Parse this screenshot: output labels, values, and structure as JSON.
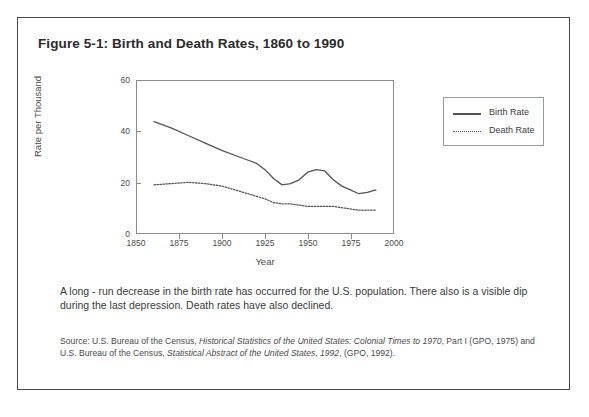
{
  "figure": {
    "title": "Figure 5-1: Birth and Death Rates, 1860 to 1990",
    "caption": "A long - run decrease in the birth rate has occurred for the U.S. population. There also is a visible dip during the last depression. Death rates have also declined.",
    "source": {
      "line1_a": "Source: U.S. Bureau of the Census, ",
      "line1_italic": "Historical Statistics of the United States: Colonial Times to 1970",
      "line1_b": ", Part I",
      "line2_a": "(GPO, 1975) and U.S. Bureau of the Census, ",
      "line2_italic": "Statistical Abstract of the United States, 1992",
      "line2_b": ", (GPO, 1992)."
    }
  },
  "chart_data": {
    "type": "line",
    "title": "Birth and Death Rates, 1860 to 1990",
    "xlabel": "Year",
    "ylabel": "Rate per Thousand",
    "xlim": [
      1850,
      2000
    ],
    "ylim": [
      0,
      60
    ],
    "xticks": [
      1850,
      1875,
      1900,
      1925,
      1950,
      1975,
      2000
    ],
    "yticks": [
      0,
      20,
      40,
      60
    ],
    "grid": false,
    "legend_position": "right",
    "x": [
      1860,
      1870,
      1880,
      1890,
      1900,
      1910,
      1920,
      1925,
      1930,
      1935,
      1940,
      1945,
      1950,
      1955,
      1960,
      1965,
      1970,
      1975,
      1980,
      1985,
      1990
    ],
    "series": [
      {
        "name": "Birth Rate",
        "style": "solid",
        "color": "#545454",
        "values": [
          44.0,
          41.5,
          38.5,
          35.5,
          32.5,
          30.0,
          27.5,
          25.0,
          21.5,
          19.0,
          19.5,
          21.0,
          24.0,
          25.0,
          24.5,
          21.0,
          18.5,
          17.0,
          15.5,
          16.0,
          17.0
        ]
      },
      {
        "name": "Death Rate",
        "style": "dotted",
        "color": "#545454",
        "values": [
          19.0,
          19.5,
          20.0,
          19.5,
          18.5,
          16.5,
          14.5,
          13.5,
          12.0,
          11.5,
          11.5,
          11.0,
          10.5,
          10.5,
          10.5,
          10.5,
          10.0,
          9.5,
          9.0,
          9.0,
          9.0
        ]
      }
    ]
  },
  "legend": {
    "items": [
      {
        "label": "Birth Rate"
      },
      {
        "label": "Death Rate"
      }
    ]
  }
}
